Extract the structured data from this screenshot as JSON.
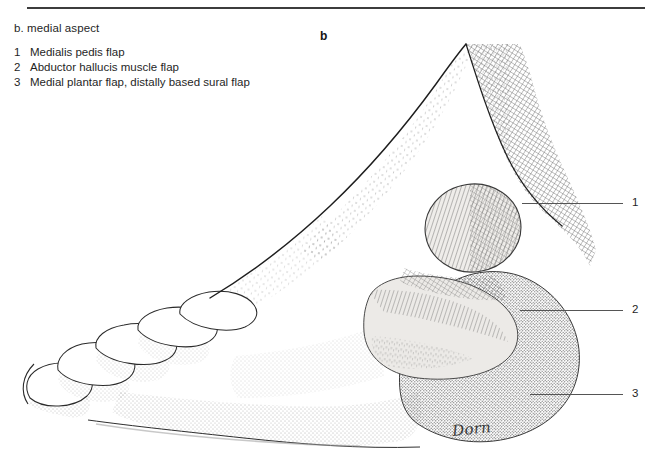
{
  "figure": {
    "panel_letter": "b",
    "caption": "b.  medial aspect",
    "legend": [
      {
        "num": "1",
        "text": "Medialis pedis flap"
      },
      {
        "num": "2",
        "text": "Abductor hallucis muscle flap"
      },
      {
        "num": "3",
        "text": "Medial plantar flap, distally based sural flap"
      }
    ],
    "callouts": [
      {
        "num": "1"
      },
      {
        "num": "2"
      },
      {
        "num": "3"
      }
    ],
    "signature": "Dorn",
    "colors": {
      "ink": "#1f1f1f",
      "rule": "#3c3c3c",
      "leader": "#555555",
      "outline": "#2a2a2a",
      "flap_fill": "#eceae7",
      "hatch": "#4a4a4a",
      "background": "#ffffff"
    },
    "illustration": {
      "subject": "right foot, medial aspect",
      "style": "pen-and-ink stipple and cross-hatch engraving",
      "regions": [
        "toes",
        "dorsum of foot",
        "medial longitudinal arch",
        "medial malleolus",
        "heel pad",
        "Achilles tendon",
        "distal leg"
      ]
    }
  }
}
